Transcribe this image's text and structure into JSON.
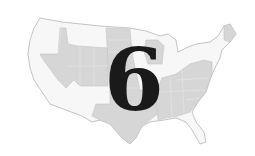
{
  "map": {
    "subject": "Contiguous United States",
    "overlay_number": "6",
    "colors": {
      "background": "#ffffff",
      "unshaded_state": "#f7f7f7",
      "shaded_state": "#d6d6d6",
      "border": "#b5b5b5",
      "number": "#1a1a1a"
    },
    "shaded_regions": [
      "Nevada",
      "Idaho",
      "Utah",
      "Wyoming",
      "Colorado",
      "North Dakota",
      "South Dakota",
      "Nebraska",
      "Kansas",
      "Oklahoma",
      "Texas",
      "Wisconsin",
      "Missouri",
      "Arkansas",
      "Louisiana",
      "Kentucky",
      "Tennessee",
      "Mississippi",
      "Alabama",
      "Georgia",
      "Ohio",
      "Indiana",
      "West Virginia",
      "Virginia",
      "Pennsylvania",
      "North Carolina",
      "South Carolina",
      "Maine"
    ],
    "unshaded_regions": [
      "Washington",
      "Oregon",
      "California",
      "Arizona",
      "New Mexico",
      "Montana",
      "Minnesota",
      "Iowa",
      "Illinois",
      "Michigan",
      "New York",
      "Florida",
      "Vermont",
      "New Hampshire",
      "Massachusetts"
    ]
  }
}
